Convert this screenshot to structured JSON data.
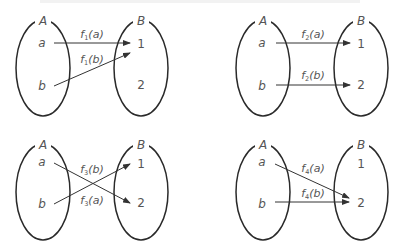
{
  "colors": {
    "ellipse": "#2a2a2a",
    "arrow": "#333333",
    "text": "#555555"
  },
  "panels": [
    {
      "id": "f1",
      "set_a_label": "A",
      "set_b_label": "B",
      "domain_elements": [
        "a",
        "b"
      ],
      "codomain_elements": [
        "1",
        "2"
      ],
      "labels": [
        {
          "f": "f",
          "sub": "1",
          "arg": "(a)"
        },
        {
          "f": "f",
          "sub": "1",
          "arg": "(b)"
        }
      ],
      "mapping": {
        "a": "1",
        "b": "1"
      }
    },
    {
      "id": "f2",
      "set_a_label": "A",
      "set_b_label": "B",
      "domain_elements": [
        "a",
        "b"
      ],
      "codomain_elements": [
        "1",
        "2"
      ],
      "labels": [
        {
          "f": "f",
          "sub": "2",
          "arg": "(a)"
        },
        {
          "f": "f",
          "sub": "2",
          "arg": "(b)"
        }
      ],
      "mapping": {
        "a": "1",
        "b": "2"
      }
    },
    {
      "id": "f3",
      "set_a_label": "A",
      "set_b_label": "B",
      "domain_elements": [
        "a",
        "b"
      ],
      "codomain_elements": [
        "1",
        "2"
      ],
      "labels": [
        {
          "f": "f",
          "sub": "3",
          "arg": "(b)"
        },
        {
          "f": "f",
          "sub": "3",
          "arg": "(a)"
        }
      ],
      "mapping": {
        "a": "2",
        "b": "1"
      }
    },
    {
      "id": "f4",
      "set_a_label": "A",
      "set_b_label": "B",
      "domain_elements": [
        "a",
        "b"
      ],
      "codomain_elements": [
        "1",
        "2"
      ],
      "labels": [
        {
          "f": "f",
          "sub": "4",
          "arg": "(a)"
        },
        {
          "f": "f",
          "sub": "4",
          "arg": "(b)"
        }
      ],
      "mapping": {
        "a": "2",
        "b": "2"
      }
    }
  ]
}
